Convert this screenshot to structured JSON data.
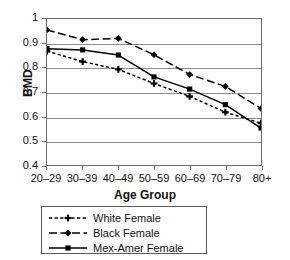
{
  "chart_data": {
    "type": "line",
    "title": "",
    "xlabel": "Age Group",
    "ylabel": "BMD",
    "categories": [
      "20–29",
      "30–39",
      "40–49",
      "50–59",
      "60–69",
      "70–79",
      "80+"
    ],
    "ylim": [
      0.4,
      1.0
    ],
    "yticks": [
      "0.4",
      "0.5",
      "0.6",
      "0.7",
      "0.8",
      "0.9",
      "1"
    ],
    "ytick_values": [
      0.4,
      0.5,
      0.6,
      0.7,
      0.8,
      0.9,
      1.0
    ],
    "grid": true,
    "legend_position": "below",
    "series": [
      {
        "name": "White Female",
        "marker": "plus",
        "line_style": "dashed-fine",
        "color": "#000000",
        "values": [
          0.868,
          0.825,
          0.793,
          0.735,
          0.682,
          0.617,
          0.572
        ]
      },
      {
        "name": "Black Female",
        "marker": "diamond",
        "line_style": "dashed-long",
        "color": "#000000",
        "values": [
          0.955,
          0.915,
          0.92,
          0.853,
          0.772,
          0.723,
          0.632
        ]
      },
      {
        "name": "Mex-Amer Female",
        "marker": "square",
        "line_style": "solid",
        "color": "#000000",
        "values": [
          0.878,
          0.873,
          0.852,
          0.762,
          0.712,
          0.648,
          0.552
        ]
      }
    ]
  },
  "legend": {
    "items": [
      {
        "label": "White Female"
      },
      {
        "label": "Black Female"
      },
      {
        "label": "Mex-Amer Female"
      }
    ]
  },
  "colors": {
    "ink": "#000000",
    "frame": "#6b6b6b",
    "grid": "#8d8d8d",
    "background": "#ffffff"
  }
}
